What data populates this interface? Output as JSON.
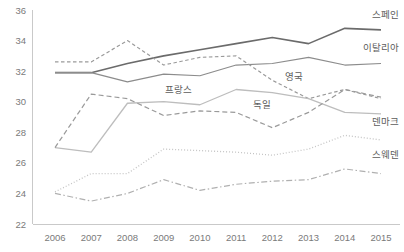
{
  "chart_data": {
    "type": "line",
    "title": "",
    "subtitle": "",
    "xlabel": "",
    "ylabel": "",
    "categories": [
      "2006",
      "2007",
      "2008",
      "2009",
      "2010",
      "2011",
      "2012",
      "2013",
      "2014",
      "2015"
    ],
    "x": [
      2006,
      2007,
      2008,
      2009,
      2010,
      2011,
      2012,
      2013,
      2014,
      2015
    ],
    "ylim": [
      22,
      36
    ],
    "yticks": [
      22,
      24,
      26,
      28,
      30,
      32,
      34,
      36
    ],
    "ytick_labels": [
      "22",
      "24",
      "26",
      "28",
      "30",
      "32",
      "34",
      "36"
    ],
    "grid": false,
    "legend_position": "inline-right",
    "series": [
      {
        "name": "스페인",
        "label": "스페인",
        "style": "solid",
        "color": "#6b6b6b",
        "width": 1.6,
        "values": [
          31.9,
          31.9,
          32.5,
          33.0,
          33.4,
          33.8,
          34.2,
          33.8,
          34.8,
          34.7
        ],
        "label_x": 2015,
        "label_y": 35.45
      },
      {
        "name": "이탈리아",
        "label": "이탈리아",
        "style": "solid",
        "color": "#8c8c8c",
        "width": 1.2,
        "values": [
          31.9,
          31.9,
          31.3,
          31.8,
          31.7,
          32.4,
          32.5,
          32.9,
          32.4,
          32.5
        ],
        "label_x": 2015,
        "label_y": 33.3
      },
      {
        "name": "영국",
        "label": "영국",
        "style": "dashed-fine",
        "color": "#9a9a9a",
        "width": 1.2,
        "values": [
          32.6,
          32.6,
          34.0,
          32.4,
          32.9,
          33.0,
          31.4,
          30.2,
          30.8,
          30.2
        ],
        "label_x": 2012.6,
        "label_y": 31.4
      },
      {
        "name": "프랑스",
        "label": "프랑스",
        "style": "solid",
        "color": "#bdbdbd",
        "width": 1.3,
        "values": [
          27.0,
          26.7,
          29.9,
          30.0,
          29.8,
          30.8,
          30.6,
          30.2,
          29.3,
          29.2
        ],
        "label_x": 2009.4,
        "label_y": 30.55
      },
      {
        "name": "독일",
        "label": "독일",
        "style": "dashed",
        "color": "#9a9a9a",
        "width": 1.2,
        "values": [
          27.0,
          30.5,
          30.2,
          29.1,
          29.4,
          29.3,
          28.3,
          29.3,
          30.8,
          30.3
        ],
        "label_x": 2011.7,
        "label_y": 29.6
      },
      {
        "name": "덴마크",
        "label": "덴마크",
        "style": "dotted",
        "color": "#c4c4c4",
        "width": 1.3,
        "values": [
          24.1,
          25.3,
          25.3,
          26.9,
          26.8,
          26.7,
          26.5,
          26.9,
          27.8,
          27.5
        ],
        "label_x": 2015,
        "label_y": 28.45
      },
      {
        "name": "스웨덴",
        "label": "스웨덴",
        "style": "dashdot",
        "color": "#b0b0b0",
        "width": 1.2,
        "values": [
          24.0,
          23.5,
          24.0,
          24.9,
          24.2,
          24.6,
          24.8,
          24.9,
          25.6,
          25.3
        ],
        "label_x": 2015,
        "label_y": 26.35
      }
    ]
  },
  "axes": {
    "y_axis_name": "value-axis",
    "x_axis_name": "year-axis"
  }
}
